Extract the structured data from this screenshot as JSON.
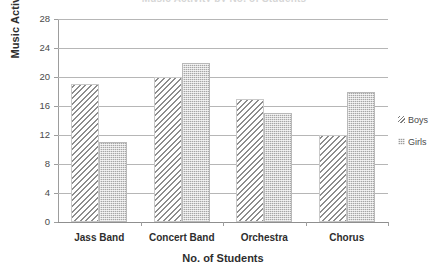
{
  "chart_data": {
    "type": "bar",
    "title": "Music Activity by No. of Students",
    "xlabel": "No. of Students",
    "ylabel": "Music Activity",
    "categories": [
      "Jass Band",
      "Concert Band",
      "Orchestra",
      "Chorus"
    ],
    "series": [
      {
        "name": "Boys",
        "values": [
          19,
          20,
          17,
          12
        ],
        "pattern": "diagonal-hatch"
      },
      {
        "name": "Girls",
        "values": [
          11,
          22,
          15,
          18
        ],
        "pattern": "dotted-checker"
      }
    ],
    "ylim": [
      0,
      28
    ],
    "ytick_step": 4,
    "yticks": [
      0,
      4,
      8,
      12,
      16,
      20,
      24,
      28
    ],
    "grid": true,
    "legend_position": "right",
    "colors": {
      "boys_hatch": "#8d8d8d",
      "girls_fill": "#a6a6a6",
      "gridline": "#b6b6b6",
      "axis": "#9d9d9d",
      "text": "#2e2e2e"
    }
  },
  "legend": {
    "entries": [
      {
        "label": "Boys"
      },
      {
        "label": "Girls"
      }
    ]
  }
}
